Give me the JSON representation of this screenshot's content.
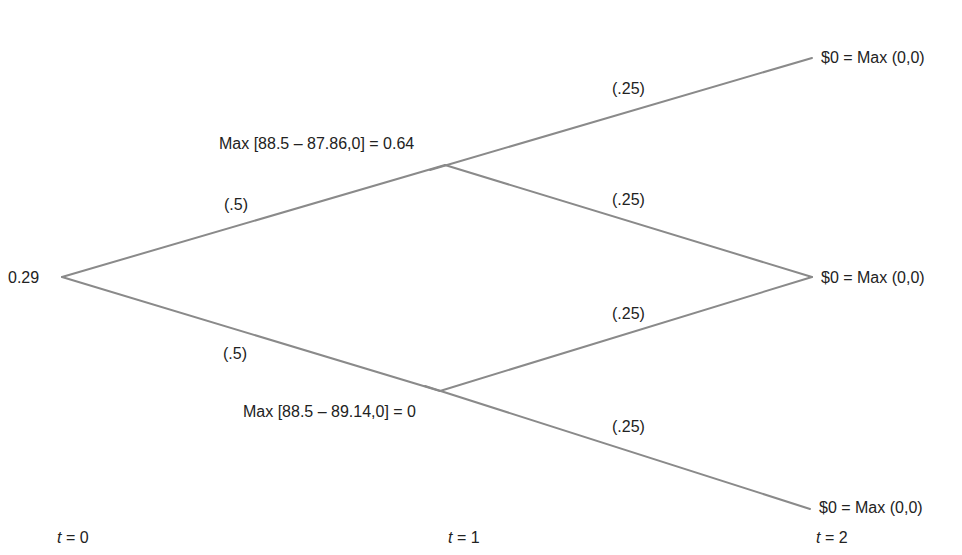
{
  "tree": {
    "root": {
      "value": "0.29"
    },
    "t1_up": {
      "label": "Max [88.5 – 87.86,0] = 0.64"
    },
    "t1_down": {
      "label": "Max [88.5 – 89.14,0] = 0"
    },
    "leaves": [
      {
        "label": "$0 = Max (0,0)"
      },
      {
        "label": "$0 = Max (0,0)"
      },
      {
        "label": "$0 = Max (0,0)"
      }
    ],
    "probabilities": {
      "root_up": "(.5)",
      "root_down": "(.5)",
      "up_up": "(.25)",
      "up_down": "(.25)",
      "down_up": "(.25)",
      "down_down": "(.25)"
    },
    "time_labels": [
      {
        "var": "t",
        "eq": " = 0"
      },
      {
        "var": "t",
        "eq": " = 1"
      },
      {
        "var": "t",
        "eq": " = 2"
      }
    ],
    "line_color": "#8a8a8a"
  }
}
